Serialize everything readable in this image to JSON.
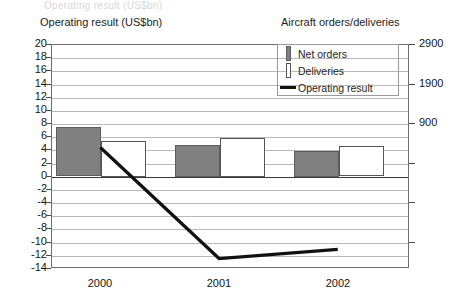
{
  "titles": {
    "left_axis": "Operating result (US$bn)",
    "right_axis": "Aircraft orders/deliveries"
  },
  "legend": {
    "items": [
      {
        "label": "Net orders",
        "swatch": "gray-bar-swatch",
        "color": "#808080"
      },
      {
        "label": "Deliveries",
        "swatch": "white-bar-swatch",
        "color": "#ffffff"
      },
      {
        "label": "Operating result",
        "swatch": "black-line-swatch",
        "color": "#111111"
      }
    ]
  },
  "chart_data": {
    "type": "bar",
    "title": "",
    "categories": [
      "2000",
      "2001",
      "2002"
    ],
    "xlabel": "",
    "ylabel": "Operating result (US$bn)",
    "y2label": "Aircraft orders/deliveries",
    "ylim": [
      -14,
      20
    ],
    "y2lim": [
      -14,
      20
    ],
    "ytick_labels": [
      "20",
      "18",
      "16",
      "14",
      "12",
      "10",
      "8",
      "6",
      "4",
      "2",
      "0",
      "-2",
      "-4",
      "-6",
      "-8",
      "-10",
      "-12",
      "-14"
    ],
    "ytick_values": [
      20,
      18,
      16,
      14,
      12,
      10,
      8,
      6,
      4,
      2,
      0,
      -2,
      -4,
      -6,
      -8,
      -10,
      -12,
      -14
    ],
    "y2tick_labels": [
      "2900",
      "1900",
      "900"
    ],
    "y2tick_values": [
      20,
      14,
      8
    ],
    "grid": true,
    "legend_position": "top-right",
    "series": [
      {
        "name": "Net orders",
        "type": "bar",
        "axis": "right",
        "color": "#808080",
        "values_left_scale": [
          7.5,
          4.8,
          3.9
        ],
        "values": [
          1120,
          675,
          525
        ]
      },
      {
        "name": "Deliveries",
        "type": "bar",
        "axis": "right",
        "color": "#ffffff",
        "values_left_scale": [
          5.4,
          5.9,
          4.6
        ],
        "values": [
          770,
          855,
          640
        ]
      },
      {
        "name": "Operating result",
        "type": "line",
        "axis": "left",
        "color": "#111111",
        "values": [
          4.3,
          -12.7,
          -11.3
        ]
      }
    ]
  },
  "ghost_top_text": "Operating result (US$bn)"
}
